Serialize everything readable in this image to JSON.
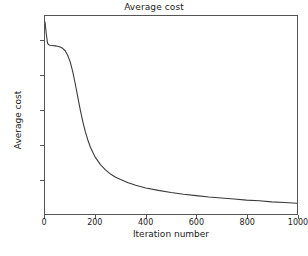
{
  "chart_data": {
    "type": "line",
    "title": "Average cost",
    "xlabel": "Iteration number",
    "ylabel": "Average cost",
    "xlim": [
      0,
      1000
    ],
    "ylim": [
      0.0,
      0.57
    ],
    "grid": false,
    "legend": null,
    "line_color": "#3a3a3a",
    "xticks": [
      0,
      200,
      400,
      600,
      800,
      1000
    ],
    "xtick_labels": [
      "0",
      "200",
      "400",
      "600",
      "800",
      "1000"
    ],
    "yticks": [
      0.1,
      0.2,
      0.3,
      0.4,
      0.5
    ],
    "ytick_labels": [
      "0.1",
      "0.2",
      "0.3",
      "0.4",
      "0.5"
    ],
    "series": [
      {
        "name": "Average cost",
        "x": [
          0,
          5,
          10,
          15,
          20,
          30,
          40,
          50,
          60,
          70,
          80,
          90,
          100,
          110,
          120,
          130,
          140,
          150,
          160,
          170,
          180,
          190,
          200,
          220,
          240,
          260,
          280,
          300,
          330,
          360,
          400,
          450,
          500,
          550,
          600,
          650,
          700,
          750,
          800,
          850,
          900,
          950,
          1000
        ],
        "y": [
          0.553,
          0.519,
          0.492,
          0.487,
          0.486,
          0.485,
          0.484,
          0.483,
          0.481,
          0.477,
          0.47,
          0.457,
          0.438,
          0.41,
          0.375,
          0.337,
          0.3,
          0.266,
          0.237,
          0.213,
          0.193,
          0.177,
          0.163,
          0.142,
          0.127,
          0.115,
          0.106,
          0.099,
          0.09,
          0.083,
          0.075,
          0.068,
          0.062,
          0.057,
          0.053,
          0.049,
          0.046,
          0.043,
          0.04,
          0.038,
          0.035,
          0.033,
          0.031
        ]
      }
    ]
  },
  "figure": {
    "background_color": "#ffffff",
    "frame_color": "#555555"
  }
}
